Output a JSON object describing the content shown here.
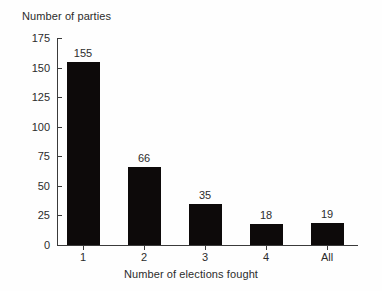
{
  "chart_data": {
    "type": "bar",
    "title": "",
    "categories": [
      "1",
      "2",
      "3",
      "4",
      "All"
    ],
    "values": [
      155,
      66,
      35,
      18,
      19
    ],
    "value_labels": [
      "155",
      "66",
      "35",
      "18",
      "19"
    ],
    "xlabel": "Number of elections fought",
    "ylabel": "Number of parties",
    "ylim": [
      0,
      175
    ],
    "yticks": [
      0,
      25,
      50,
      75,
      100,
      125,
      150,
      175
    ],
    "ytick_labels": [
      "0",
      "25",
      "50",
      "75",
      "100",
      "125",
      "150",
      "175"
    ],
    "grid": false,
    "legend": false,
    "bar_color": "#0d0a0a",
    "axis_color": "#3a3a3a",
    "background_color": "#ffffff"
  },
  "axes": {
    "y_title": "Number of parties",
    "x_title": "Number of elections fought"
  }
}
